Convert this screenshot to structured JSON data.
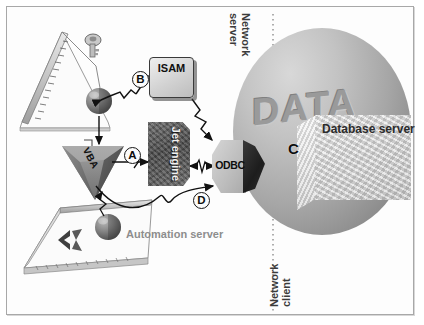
{
  "diagram": {
    "frame": {
      "border_color": "#a8a8a8",
      "background": "#ffffff"
    },
    "nodes": {
      "isam": {
        "label": "ISAM",
        "kind": "rounded-box",
        "fill": "#d2d2d2",
        "text_color": "#101010"
      },
      "jet_engine": {
        "label": "Jet\nengine",
        "kind": "textured-box",
        "fill": "#4a4a4a",
        "text_color": "#f2f2f2",
        "rotation": "90deg"
      },
      "odbc": {
        "label": "ODBC",
        "kind": "hexagon-3d",
        "fill_light": "#bcbcbc",
        "fill_dark": "#1d1d1d",
        "text_color": "#0d0d0d"
      },
      "vba": {
        "label": "VBA",
        "kind": "inverted-pyramid",
        "fill": "#8a8a8a",
        "text_color": "#111111"
      },
      "data_sphere": {
        "label": "DATA",
        "kind": "sphere",
        "fill": "#a6a6a6",
        "text_color": "#9a9a9a"
      },
      "database_server": {
        "label": "Database\nserver",
        "kind": "3d-block",
        "fill": "#dadada",
        "text_color": "#2b2b2b"
      },
      "automation_server": {
        "label": "Automation\nserver",
        "kind": "text-label",
        "text_color": "#8d8d8d"
      },
      "access_window": {
        "label": "",
        "kind": "skewed-window"
      },
      "excel_window": {
        "label": "",
        "kind": "skewed-window"
      }
    },
    "boundary": {
      "server_side_label": "Network\nserver",
      "client_side_label": "Network\nclient",
      "divider_style": "dotted"
    },
    "callouts": [
      {
        "id": "A",
        "label": "A",
        "circled": true
      },
      {
        "id": "B",
        "label": "B",
        "circled": true
      },
      {
        "id": "C",
        "label": "C",
        "circled": false
      },
      {
        "id": "D",
        "label": "D",
        "circled": true
      }
    ],
    "icons": {
      "key": "key-icon",
      "excel": "excel-x-icon",
      "sphere_small_top": "sphere-node-icon",
      "sphere_small_bottom": "sphere-node-icon"
    }
  }
}
